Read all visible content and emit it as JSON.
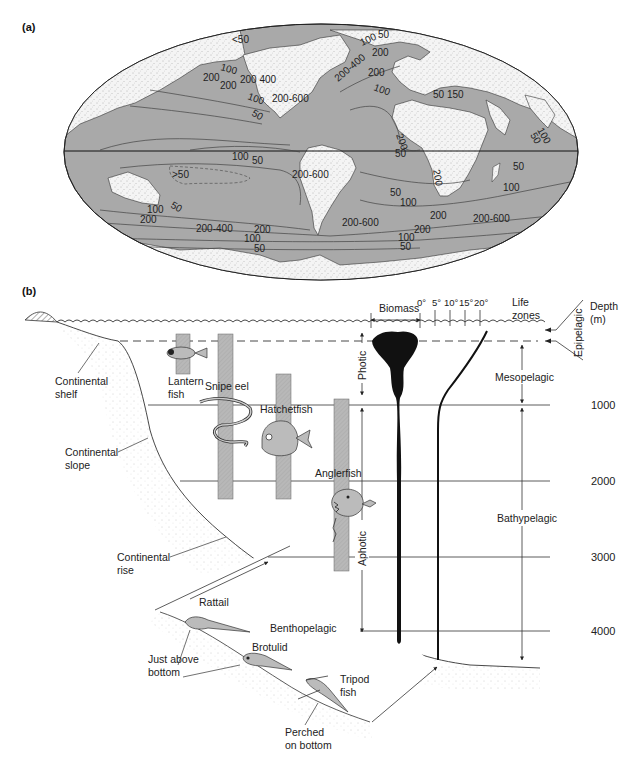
{
  "panel_a": {
    "label": "(a)",
    "contours": [
      {
        "text": "<50",
        "x": 232,
        "y": 43
      },
      {
        "text": "100",
        "x": 220,
        "y": 70,
        "rot": 15
      },
      {
        "text": "200",
        "x": 203,
        "y": 81
      },
      {
        "text": "200",
        "x": 220,
        "y": 89
      },
      {
        "text": "200 400",
        "x": 240,
        "y": 83
      },
      {
        "text": "100",
        "x": 247,
        "y": 99,
        "rot": 20
      },
      {
        "text": "200-600",
        "x": 272,
        "y": 102
      },
      {
        "text": "50",
        "x": 251,
        "y": 115,
        "rot": 30
      },
      {
        "text": "50",
        "x": 378,
        "y": 38
      },
      {
        "text": "100",
        "x": 362,
        "y": 46,
        "rot": -25
      },
      {
        "text": "200",
        "x": 372,
        "y": 56
      },
      {
        "text": "200-400",
        "x": 338,
        "y": 82,
        "rot": -40
      },
      {
        "text": "200",
        "x": 368,
        "y": 76
      },
      {
        "text": "100",
        "x": 373,
        "y": 90,
        "rot": 20
      },
      {
        "text": "50 150",
        "x": 433,
        "y": 98
      },
      {
        "text": "200",
        "x": 396,
        "y": 135,
        "rot": 70
      },
      {
        "text": "50",
        "x": 530,
        "y": 135,
        "rot": 60
      },
      {
        "text": "100",
        "x": 537,
        "y": 130,
        "rot": 60
      },
      {
        "text": "100",
        "x": 232,
        "y": 160
      },
      {
        "text": "50",
        "x": 252,
        "y": 164
      },
      {
        "text": ">50",
        "x": 172,
        "y": 178
      },
      {
        "text": "200-600",
        "x": 292,
        "y": 178
      },
      {
        "text": "50",
        "x": 395,
        "y": 157
      },
      {
        "text": "200",
        "x": 433,
        "y": 170,
        "rot": 80
      },
      {
        "text": "50",
        "x": 513,
        "y": 170
      },
      {
        "text": "100",
        "x": 503,
        "y": 191
      },
      {
        "text": "50",
        "x": 390,
        "y": 196
      },
      {
        "text": "100",
        "x": 400,
        "y": 206
      },
      {
        "text": "50",
        "x": 170,
        "y": 207,
        "rot": 30
      },
      {
        "text": "100",
        "x": 147,
        "y": 213
      },
      {
        "text": "200",
        "x": 140,
        "y": 223
      },
      {
        "text": "200-600",
        "x": 342,
        "y": 226
      },
      {
        "text": "200",
        "x": 430,
        "y": 219
      },
      {
        "text": "200-600",
        "x": 473,
        "y": 222
      },
      {
        "text": "200-400",
        "x": 196,
        "y": 232
      },
      {
        "text": "200",
        "x": 254,
        "y": 233
      },
      {
        "text": "100",
        "x": 244,
        "y": 242
      },
      {
        "text": "50",
        "x": 254,
        "y": 252
      },
      {
        "text": "200",
        "x": 414,
        "y": 233
      },
      {
        "text": "100",
        "x": 398,
        "y": 241
      },
      {
        "text": "50",
        "x": 400,
        "y": 250
      }
    ]
  },
  "panel_b": {
    "label": "(b)",
    "header": {
      "biomass": "Biomass",
      "temps": [
        "0°",
        "5°",
        "10°",
        "15°",
        "20°"
      ],
      "life_zones": [
        "Life",
        "zones"
      ],
      "depth": [
        "Depth",
        "(m)"
      ]
    },
    "depth_ticks": [
      {
        "label": "1000",
        "y": 405
      },
      {
        "label": "2000",
        "y": 481
      },
      {
        "label": "3000",
        "y": 557
      },
      {
        "label": "4000",
        "y": 631
      }
    ],
    "light_zones": {
      "photic": "Photic",
      "aphotic": "Aphotic"
    },
    "life_zones": {
      "epipelagic": "Epipelagic",
      "mesopelagic": "Mesopelagic",
      "bathypelagic": "Bathypelagic",
      "benthopelagic": "Benthopelagic"
    },
    "seafloor_labels": {
      "shelf": [
        "Continental",
        "shelf"
      ],
      "slope": [
        "Continental",
        "slope"
      ],
      "rise": [
        "Continental",
        "rise"
      ]
    },
    "fish": [
      {
        "name": "Lantern fish",
        "lines": [
          "Lantern",
          "fish"
        ]
      },
      {
        "name": "Snipe eel",
        "lines": [
          "Snipe eel"
        ]
      },
      {
        "name": "Hatchetfish",
        "lines": [
          "Hatchetfish"
        ]
      },
      {
        "name": "Anglerfish",
        "lines": [
          "Anglerfish"
        ]
      },
      {
        "name": "Rattail",
        "lines": [
          "Rattail"
        ]
      },
      {
        "name": "Brotulid",
        "lines": [
          "Brotulid"
        ]
      },
      {
        "name": "Tripod fish",
        "lines": [
          "Tripod",
          "fish"
        ]
      }
    ],
    "benthic_labels": {
      "above": [
        "Just above",
        "bottom"
      ],
      "perched": [
        "Perched",
        "on bottom"
      ]
    }
  },
  "colors": {
    "ocean": "#a8a8a8",
    "land": "#f2f2f2",
    "bar": "#b5b5b5",
    "ink": "#222222",
    "biomass": "#111111"
  }
}
